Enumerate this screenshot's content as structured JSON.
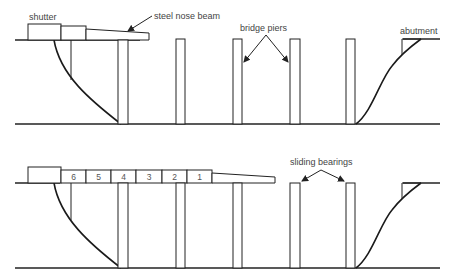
{
  "diagram": {
    "top_panel": {
      "labels": {
        "shutter": "shutter",
        "nose_beam": "steel nose beam",
        "piers": "bridge piers",
        "abutment": "abutment"
      }
    },
    "bottom_panel": {
      "labels": {
        "bearings": "sliding bearings"
      },
      "segments": [
        "6",
        "5",
        "4",
        "3",
        "2",
        "1"
      ]
    },
    "colors": {
      "line": "#222222",
      "text": "#444444",
      "background": "#ffffff"
    }
  }
}
